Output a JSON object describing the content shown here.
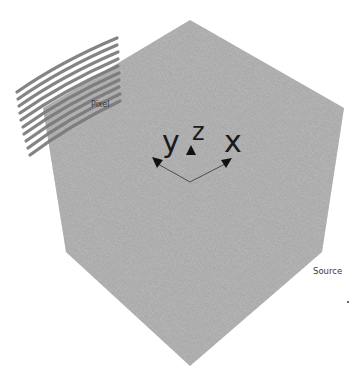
{
  "diagram": {
    "title": "",
    "labels": {
      "pixel": "Pixel",
      "source": "Source"
    },
    "axes": {
      "x": "x",
      "y": "y",
      "z": "z"
    },
    "colors": {
      "cube_fill": "#a9a9a9",
      "stripe": "#7c7c7c",
      "axis_line": "#2a2a2a",
      "text": "#1a1a1a"
    },
    "stripe_count": 10
  }
}
